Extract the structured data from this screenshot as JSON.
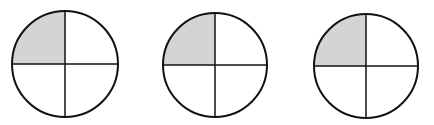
{
  "diagram": {
    "shade_color": "#d4d4d4",
    "stroke_color": "#111111",
    "circles": [
      {
        "cx": 65,
        "cy": 64,
        "r": 53,
        "parts": 4,
        "shaded": [
          "top-left"
        ]
      },
      {
        "cx": 215,
        "cy": 65,
        "r": 52,
        "parts": 4,
        "shaded": [
          "top-left"
        ]
      },
      {
        "cx": 366,
        "cy": 66,
        "r": 52,
        "parts": 4,
        "shaded": [
          "top-left"
        ]
      }
    ]
  }
}
